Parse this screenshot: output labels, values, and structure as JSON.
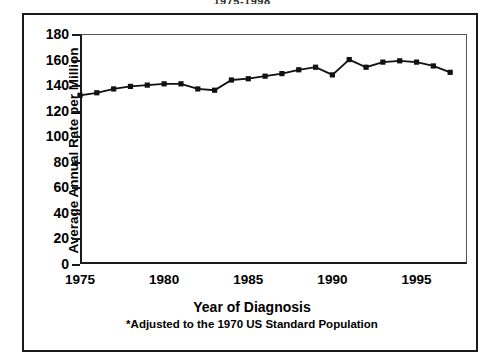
{
  "figure": {
    "super_title": "1975-1998",
    "y_axis_title": "Average Annual Rate per Million",
    "x_axis_title": "Year of Diagnosis",
    "footnote": "*Adjusted to the 1970 US Standard Population",
    "line_color": "#111111",
    "marker_color": "#111111",
    "frame_color": "#1a1a1a",
    "background": "#ffffff"
  },
  "chart_data": {
    "type": "line",
    "title": "1975-1998",
    "xlabel": "Year of Diagnosis",
    "ylabel": "Average Annual Rate per Million",
    "annotations": [
      "*Adjusted to the 1970 US Standard Population"
    ],
    "grid": false,
    "legend": false,
    "xlim": [
      1975,
      1998
    ],
    "ylim": [
      0,
      180
    ],
    "xticks": [
      1975,
      1980,
      1985,
      1990,
      1995
    ],
    "yticks": [
      0,
      20,
      40,
      60,
      80,
      100,
      120,
      140,
      160,
      180
    ],
    "x": [
      1975,
      1976,
      1977,
      1978,
      1979,
      1980,
      1981,
      1982,
      1983,
      1984,
      1985,
      1986,
      1987,
      1988,
      1989,
      1990,
      1991,
      1992,
      1993,
      1994,
      1995,
      1996,
      1997
    ],
    "values": [
      132,
      134,
      137,
      139,
      140,
      141,
      141,
      137,
      136,
      144,
      145,
      147,
      149,
      152,
      154,
      148,
      160,
      154,
      158,
      159,
      158,
      155,
      150
    ],
    "series": [
      {
        "name": "Average annual rate per million",
        "marker": "square",
        "values": [
          132,
          134,
          137,
          139,
          140,
          141,
          141,
          137,
          136,
          144,
          145,
          147,
          149,
          152,
          154,
          148,
          160,
          154,
          158,
          159,
          158,
          155,
          150
        ]
      }
    ]
  }
}
